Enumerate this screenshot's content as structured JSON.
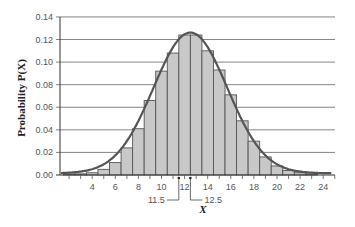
{
  "chart_data": {
    "type": "bar",
    "subtype": "histogram-with-normal-curve-overlay",
    "title": "",
    "xlabel": "X",
    "ylabel": "Probability P(X)",
    "x": [
      2,
      3,
      4,
      5,
      6,
      7,
      8,
      9,
      10,
      11,
      12,
      13,
      14,
      15,
      16,
      17,
      18,
      19,
      20,
      21,
      22,
      23
    ],
    "values": [
      0.001,
      0.001,
      0.002,
      0.005,
      0.011,
      0.024,
      0.041,
      0.066,
      0.092,
      0.108,
      0.124,
      0.124,
      0.11,
      0.093,
      0.071,
      0.048,
      0.03,
      0.016,
      0.008,
      0.004,
      0.002,
      0.001
    ],
    "series": [
      {
        "name": "Histogram",
        "kind": "bar",
        "values": [
          0.001,
          0.001,
          0.002,
          0.005,
          0.011,
          0.024,
          0.041,
          0.066,
          0.092,
          0.108,
          0.124,
          0.124,
          0.11,
          0.093,
          0.071,
          0.048,
          0.03,
          0.016,
          0.008,
          0.004,
          0.002,
          0.001
        ]
      },
      {
        "name": "Normal curve",
        "kind": "line",
        "mean": 12.5,
        "sd": 3.2
      }
    ],
    "xticks": [
      4,
      6,
      8,
      10,
      12,
      14,
      16,
      18,
      20,
      22,
      24
    ],
    "yticks": [
      "0.00",
      "0.02",
      "0.04",
      "0.06",
      "0.08",
      "0.10",
      "0.12",
      "0.14"
    ],
    "xlim": [
      1.2,
      25
    ],
    "ylim": [
      0,
      0.14
    ],
    "grid": "horizontal",
    "legend": "none",
    "annotations": [
      {
        "text": "11.5",
        "x": 11.5
      },
      {
        "text": "12.5",
        "x": 12.5
      }
    ]
  },
  "colors": {
    "bar_fill": "#c8c8c8",
    "bar_edge": "#555555",
    "curve": "#555555",
    "grid": "#666666",
    "text": "#555555"
  }
}
